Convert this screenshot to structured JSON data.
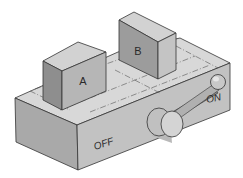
{
  "diagram": {
    "type": "isometric-switch-mechanism",
    "labels": {
      "block_a": "A",
      "block_b": "B",
      "position_off": "OFF",
      "position_on": "ON"
    },
    "colors": {
      "top_face": "#d6d6d6",
      "front_face": "#bdbdbd",
      "side_face": "#a5a5a5",
      "block_front": "#b5b5b5",
      "block_side": "#8f8f8f",
      "block_top": "#cfcfcf",
      "outline": "#333333",
      "background": "#ffffff"
    }
  }
}
